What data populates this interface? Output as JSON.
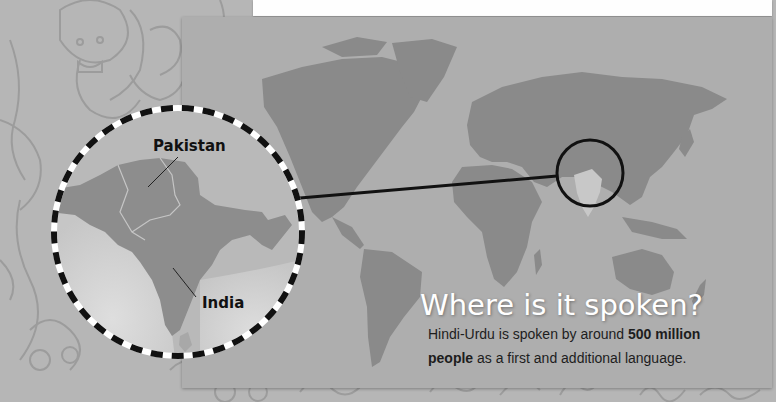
{
  "map": {
    "labels": {
      "pakistan": "Pakistan",
      "india": "India"
    }
  },
  "info": {
    "title": "Where is it spoken?",
    "body_part1": "Hindi-Urdu is spoken by around ",
    "body_bold1": "500 million",
    "body_bold2": "people",
    "body_part2": " as a first and additional language."
  },
  "colors": {
    "background": "#b6b6b6",
    "panel": "#aeaeae",
    "land": "#8a8a8a",
    "highlight_land": "#c8c8c8",
    "title": "#ffffff",
    "text": "#1d1d1d"
  }
}
